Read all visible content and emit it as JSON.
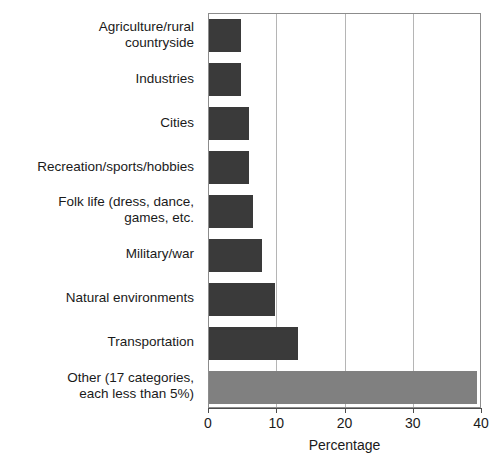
{
  "chart_data": {
    "type": "bar",
    "orientation": "horizontal",
    "title": "",
    "xlabel": "Percentage",
    "ylabel": "",
    "xlim": [
      0,
      40
    ],
    "xticks": [
      0,
      10,
      20,
      30,
      40
    ],
    "grid": "vertical",
    "legend": "none",
    "categories": [
      "Agriculture/rural\ncountryside",
      "Industries",
      "Cities",
      "Recreation/sports/hobbies",
      "Folk life (dress, dance,\ngames, etc.",
      "Military/war",
      "Natural environments",
      "Transportation",
      "Other (17 categories,\neach less than 5%)"
    ],
    "values": [
      4.7,
      4.7,
      5.9,
      5.9,
      6.5,
      7.7,
      9.6,
      13.0,
      39.3
    ],
    "colors": [
      "#3a3a3a",
      "#3a3a3a",
      "#3a3a3a",
      "#3a3a3a",
      "#3a3a3a",
      "#3a3a3a",
      "#3a3a3a",
      "#3a3a3a",
      "#808080"
    ]
  },
  "style": {
    "bar_dark": "#3a3a3a",
    "bar_light": "#808080",
    "frame": "#8c8c8c",
    "gridline": "#b5b5b5",
    "axis": "#4d4d4d",
    "background": "#ffffff",
    "text": "#1a1a1a"
  }
}
